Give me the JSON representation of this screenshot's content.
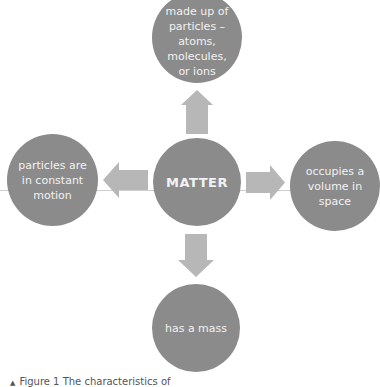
{
  "diagram": {
    "center": {
      "label": "MATTER"
    },
    "nodes": [
      {
        "position": "top",
        "label": "made up of particles – atoms, molecules, or ions"
      },
      {
        "position": "left",
        "label": "particles are in constant motion"
      },
      {
        "position": "right",
        "label": "occupies a volume in space"
      },
      {
        "position": "bottom",
        "label": "has a mass"
      }
    ],
    "arrows": [
      "up",
      "left",
      "right",
      "down"
    ],
    "colors": {
      "circle": "#8b8b8b",
      "arrow": "#b7b7b7",
      "text": "#f2f2f2"
    }
  },
  "caption": {
    "marker": "▲",
    "text": "Figure 1 The characteristics of"
  }
}
